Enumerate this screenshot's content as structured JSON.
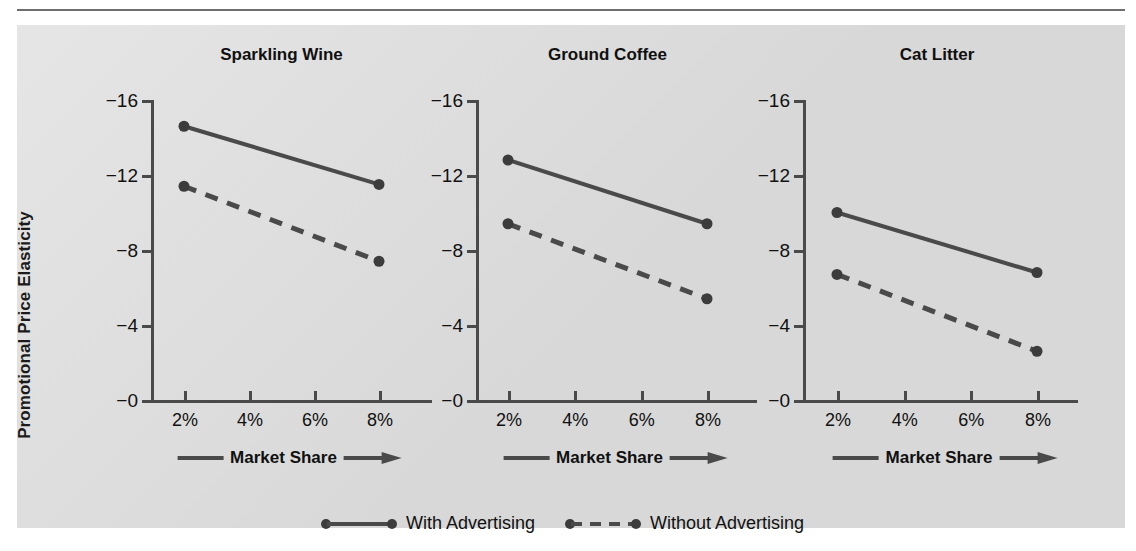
{
  "figure": {
    "background_color": "#d8d8d8",
    "line_color": "#4a4a4a",
    "y_axis_title": "Promotional Price Elasticity",
    "x_axis_caption": "Market Share"
  },
  "legend": {
    "items": [
      {
        "label": "With Advertising",
        "style": "solid"
      },
      {
        "label": "Without Advertising",
        "style": "dashed"
      }
    ]
  },
  "chart_data": [
    {
      "type": "line",
      "title": "Sparkling Wine",
      "xlabel": "Market Share",
      "ylabel": "Promotional Price Elasticity",
      "categories": [
        "2%",
        "4%",
        "6%",
        "8%"
      ],
      "x": [
        2,
        8
      ],
      "ytick_labels": [
        "−0",
        "−4",
        "−8",
        "−12",
        "−16"
      ],
      "yticks": [
        0,
        -4,
        -8,
        -12,
        -16
      ],
      "ylim": [
        0,
        -16
      ],
      "grid": false,
      "legend_position": "bottom-center",
      "series": [
        {
          "name": "With Advertising",
          "style": "solid",
          "x": [
            2,
            8
          ],
          "values": [
            -14.6,
            -11.5
          ]
        },
        {
          "name": "Without Advertising",
          "style": "dashed",
          "x": [
            2,
            8
          ],
          "values": [
            -11.4,
            -7.4
          ]
        }
      ]
    },
    {
      "type": "line",
      "title": "Ground Coffee",
      "xlabel": "Market Share",
      "ylabel": "Promotional Price Elasticity",
      "categories": [
        "2%",
        "4%",
        "6%",
        "8%"
      ],
      "x": [
        2,
        8
      ],
      "ytick_labels": [
        "−0",
        "−4",
        "−8",
        "−12",
        "−16"
      ],
      "yticks": [
        0,
        -4,
        -8,
        -12,
        -16
      ],
      "ylim": [
        0,
        -16
      ],
      "grid": false,
      "legend_position": "bottom-center",
      "series": [
        {
          "name": "With Advertising",
          "style": "solid",
          "x": [
            2,
            8
          ],
          "values": [
            -12.8,
            -9.4
          ]
        },
        {
          "name": "Without Advertising",
          "style": "dashed",
          "x": [
            2,
            8
          ],
          "values": [
            -9.4,
            -5.4
          ]
        }
      ]
    },
    {
      "type": "line",
      "title": "Cat Litter",
      "xlabel": "Market Share",
      "ylabel": "Promotional Price Elasticity",
      "categories": [
        "2%",
        "4%",
        "6%",
        "8%"
      ],
      "x": [
        2,
        8
      ],
      "ytick_labels": [
        "−0",
        "−4",
        "−8",
        "−12",
        "−16"
      ],
      "yticks": [
        0,
        -4,
        -8,
        -12,
        -16
      ],
      "ylim": [
        0,
        -16
      ],
      "grid": false,
      "legend_position": "bottom-center",
      "series": [
        {
          "name": "With Advertising",
          "style": "solid",
          "x": [
            2,
            8
          ],
          "values": [
            -10.0,
            -6.8
          ]
        },
        {
          "name": "Without Advertising",
          "style": "dashed",
          "x": [
            2,
            8
          ],
          "values": [
            -6.7,
            -2.6
          ]
        }
      ]
    }
  ]
}
